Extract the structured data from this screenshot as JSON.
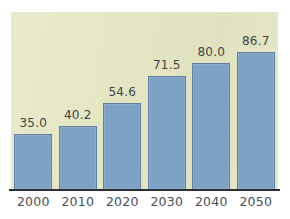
{
  "chart_data": {
    "type": "bar",
    "title": "",
    "subtitle": "",
    "xlabel": "",
    "ylabel": "",
    "categories": [
      "2000",
      "2010",
      "2020",
      "2030",
      "2040",
      "2050"
    ],
    "values": [
      35.0,
      40.2,
      54.6,
      71.5,
      80.0,
      86.7
    ],
    "value_labels": [
      "35.0",
      "40.2",
      "54.6",
      "71.5",
      "80.0",
      "86.7"
    ],
    "series": [
      {
        "name": "",
        "values": [
          35.0,
          40.2,
          54.6,
          71.5,
          80.0,
          86.7
        ]
      }
    ],
    "ylim": [
      0,
      112
    ],
    "grid": false,
    "legend": false,
    "legend_position": "none",
    "annotations": []
  },
  "style": {
    "panel_background": "#e4e6c3",
    "figure_background": "#ffffff",
    "bar_fill": "#7da2c4",
    "bar_border": "#5f7fa3",
    "axis_line": "#2b3038",
    "value_label_color": "#3f4348",
    "tick_label_color": "#4a4f55"
  }
}
